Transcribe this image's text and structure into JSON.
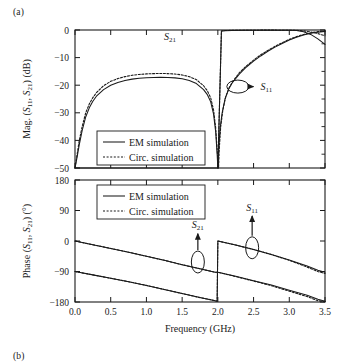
{
  "figure": {
    "panel_a_label": "(a)",
    "panel_b_label": "(b)"
  },
  "chart_data": [
    {
      "type": "line",
      "title": "",
      "panel": "(a)",
      "xlabel": "",
      "ylabel": "Mag. (S11, S21) (dB)",
      "ylabel_parts": {
        "pre": "Mag. (",
        "s1": "S",
        "s1sub": "11",
        "mid": ", ",
        "s2": "S",
        "s2sub": "21",
        "post": ") (dB)"
      },
      "xlim": [
        0.0,
        3.5
      ],
      "ylim": [
        -50,
        0
      ],
      "xticks": [
        0.0,
        0.5,
        1.0,
        1.5,
        2.0,
        2.5,
        3.0,
        3.5
      ],
      "xticklabels": [
        "0.0",
        "0.5",
        "1.0",
        "1.5",
        "2.0",
        "2.5",
        "3.0",
        "3.5"
      ],
      "yticks": [
        0,
        -10,
        -20,
        -30,
        -40,
        -50
      ],
      "yticklabels": [
        "0",
        "−10",
        "−20",
        "−30",
        "−40",
        "−50"
      ],
      "grid": false,
      "legend": {
        "position": "lower-left-inside",
        "entries": [
          {
            "label": "EM simulation",
            "style": "solid"
          },
          {
            "label": "Circ. simulation",
            "style": "dotted"
          }
        ]
      },
      "annotations": [
        {
          "text": "S21",
          "base": "S",
          "sub": "21",
          "x_ghz": 1.33,
          "y_db": -2.2,
          "pointer": "none"
        },
        {
          "text": "S11",
          "base": "S",
          "sub": "11",
          "x_ghz": 2.68,
          "y_db": -20.5,
          "pointer": "ellipse-arrow-right",
          "ellipse_x_ghz": 2.28,
          "ellipse_y_db": -20.5
        }
      ],
      "series": [
        {
          "name": "S21 EM simulation",
          "style": "solid",
          "x": [
            0.0,
            0.05,
            0.1,
            0.15,
            0.2,
            0.3,
            0.4,
            0.5,
            0.6,
            0.7,
            0.8,
            1.0,
            1.2,
            1.4,
            1.6,
            1.8,
            1.9,
            1.95,
            2.0,
            2.05,
            2.1,
            2.2,
            2.4,
            2.6,
            2.8,
            3.0,
            3.1,
            3.2,
            3.3,
            3.4,
            3.5
          ],
          "y": [
            -50,
            -50,
            -50,
            -50,
            -50,
            -50,
            -50,
            -50,
            -50,
            -50,
            -50,
            -50,
            -50,
            -50,
            -50,
            -50,
            -50,
            -50,
            -50,
            -0.4,
            -0.25,
            -0.15,
            -0.1,
            -0.08,
            -0.08,
            -0.1,
            -0.2,
            -0.6,
            -1.6,
            -3.2,
            -5.2
          ]
        },
        {
          "name": "S21 Circ. simulation",
          "style": "dotted",
          "x": [
            2.0,
            2.05,
            2.1,
            2.2,
            2.4,
            2.6,
            2.8,
            3.0,
            3.1,
            3.2,
            3.3,
            3.4,
            3.5
          ],
          "y": [
            -50,
            -0.35,
            -0.2,
            -0.12,
            -0.08,
            -0.06,
            -0.06,
            -0.08,
            -0.12,
            -0.3,
            -0.7,
            -1.3,
            -2.1
          ]
        },
        {
          "name": "S11 EM simulation",
          "style": "solid",
          "x": [
            0.0,
            0.03,
            0.06,
            0.1,
            0.15,
            0.2,
            0.25,
            0.3,
            0.4,
            0.5,
            0.6,
            0.7,
            0.8,
            0.9,
            1.0,
            1.1,
            1.2,
            1.3,
            1.4,
            1.5,
            1.6,
            1.7,
            1.8,
            1.85,
            1.9,
            1.94,
            1.97,
            1.99,
            2.0,
            2.01,
            2.03,
            2.06,
            2.1,
            2.15,
            2.2,
            2.3,
            2.4,
            2.5,
            2.6,
            2.7,
            2.8,
            2.9,
            3.0,
            3.1,
            3.2,
            3.3,
            3.4,
            3.5
          ],
          "y": [
            -50,
            -46,
            -41.5,
            -36.5,
            -31.5,
            -28.2,
            -25.8,
            -24.0,
            -21.6,
            -20.0,
            -19.0,
            -18.3,
            -17.8,
            -17.5,
            -17.3,
            -17.2,
            -17.15,
            -17.2,
            -17.35,
            -17.7,
            -18.3,
            -19.4,
            -21.6,
            -23.3,
            -26.0,
            -30.5,
            -37.0,
            -45.0,
            -50,
            -44.0,
            -36.0,
            -30.0,
            -25.0,
            -21.5,
            -19.2,
            -16.0,
            -13.4,
            -11.3,
            -9.4,
            -7.7,
            -6.2,
            -4.9,
            -3.6,
            -2.6,
            -1.8,
            -1.2,
            -0.8,
            -0.5
          ]
        },
        {
          "name": "S11 Circ. simulation",
          "style": "dotted",
          "x": [
            0.0,
            0.03,
            0.06,
            0.1,
            0.15,
            0.2,
            0.25,
            0.3,
            0.4,
            0.5,
            0.6,
            0.7,
            0.8,
            0.9,
            1.0,
            1.1,
            1.2,
            1.3,
            1.4,
            1.5,
            1.6,
            1.7,
            1.8,
            1.85,
            1.9,
            1.94,
            1.97,
            1.99,
            2.01,
            2.02,
            2.04,
            2.07,
            2.11,
            2.16,
            2.21,
            2.3,
            2.4,
            2.5,
            2.6,
            2.7,
            2.8,
            2.9,
            3.0,
            3.1,
            3.2,
            3.3,
            3.4,
            3.5
          ],
          "y": [
            -50,
            -45,
            -40.0,
            -35.0,
            -30.0,
            -26.8,
            -24.5,
            -22.7,
            -20.2,
            -18.6,
            -17.6,
            -16.9,
            -16.4,
            -16.1,
            -15.9,
            -15.8,
            -15.75,
            -15.8,
            -15.95,
            -16.3,
            -16.9,
            -18.0,
            -20.2,
            -21.9,
            -24.6,
            -29.0,
            -35.5,
            -43.5,
            -50,
            -43.0,
            -35.0,
            -29.0,
            -24.2,
            -20.8,
            -18.6,
            -15.5,
            -13.0,
            -10.9,
            -9.0,
            -7.4,
            -5.9,
            -4.6,
            -3.4,
            -2.4,
            -1.6,
            -1.0,
            -0.6,
            -0.35
          ]
        }
      ]
    },
    {
      "type": "line",
      "panel": "(b)",
      "title": "",
      "xlabel": "Frequency (GHz)",
      "ylabel": "Phase (S11, S21) (°)",
      "ylabel_parts": {
        "pre": "Phase (",
        "s1": "S",
        "s1sub": "11",
        "mid": ", ",
        "s2": "S",
        "s2sub": "21",
        "post": ") (°)"
      },
      "xlim": [
        0.0,
        3.5
      ],
      "ylim": [
        -180,
        180
      ],
      "xticks": [
        0.0,
        0.5,
        1.0,
        1.5,
        2.0,
        2.5,
        3.0,
        3.5
      ],
      "xticklabels": [
        "0.0",
        "0.5",
        "1.0",
        "1.5",
        "2.0",
        "2.5",
        "3.0",
        "3.5"
      ],
      "yticks": [
        180,
        90,
        0,
        -90,
        -180
      ],
      "yticklabels": [
        "180",
        "90",
        "0",
        "−90",
        "−180"
      ],
      "grid": false,
      "legend": {
        "position": "upper-left-inside",
        "entries": [
          {
            "label": "EM simulation",
            "style": "solid"
          },
          {
            "label": "Circ. simulation",
            "style": "dotted"
          }
        ]
      },
      "annotations": [
        {
          "text": "S21",
          "base": "S",
          "sub": "21",
          "x_ghz": 1.72,
          "y_deg": 48,
          "pointer": "ellipse-arrow-up",
          "ellipse_x_ghz": 1.72,
          "ellipse_y_deg": -62
        },
        {
          "text": "S11",
          "base": "S",
          "sub": "11",
          "x_ghz": 2.48,
          "y_deg": 100,
          "pointer": "ellipse-arrow-up",
          "ellipse_x_ghz": 2.48,
          "ellipse_y_deg": -20
        }
      ],
      "series": [
        {
          "name": "S21 EM simulation",
          "style": "solid",
          "x": [
            0.0,
            0.25,
            0.5,
            0.75,
            1.0,
            1.25,
            1.5,
            1.75,
            1.96,
            1.96,
            2.0,
            2.25,
            2.5,
            2.75,
            3.0,
            3.25,
            3.4,
            3.4,
            3.5
          ],
          "y": [
            0,
            -11,
            -22,
            -33,
            -45,
            -57,
            -70,
            -82,
            -92,
            -92,
            -92,
            -104,
            -117,
            -130,
            -145,
            -160,
            -172,
            -172,
            -178
          ]
        },
        {
          "name": "S21 Circ. simulation",
          "style": "dotted",
          "x": [
            0.0,
            0.25,
            0.5,
            0.75,
            1.0,
            1.25,
            1.5,
            1.75,
            1.96,
            2.0,
            2.25,
            2.5,
            2.75,
            3.0,
            3.25,
            3.4,
            3.5
          ],
          "y": [
            0,
            -11,
            -22,
            -33,
            -45,
            -57,
            -70,
            -82,
            -92,
            -92,
            -105,
            -118,
            -132,
            -148,
            -164,
            -176,
            -179
          ]
        },
        {
          "name": "S11 EM simulation",
          "style": "solid",
          "x": [
            0.0,
            0.25,
            0.5,
            0.75,
            1.0,
            1.25,
            1.5,
            1.75,
            1.96,
            1.99,
            2.0,
            2.25,
            2.5,
            2.75,
            3.0,
            3.25,
            3.4,
            3.5
          ],
          "y": [
            -90,
            -100,
            -110,
            -120,
            -131,
            -143,
            -155,
            -167,
            -176,
            -178,
            0,
            -12,
            -25,
            -40,
            -56,
            -74,
            -86,
            -92
          ]
        },
        {
          "name": "S11 Circ. simulation",
          "style": "dotted",
          "x": [
            0.0,
            0.25,
            0.5,
            0.75,
            1.0,
            1.25,
            1.5,
            1.75,
            1.96,
            1.99,
            2.0,
            2.25,
            2.5,
            2.75,
            3.0,
            3.25,
            3.4,
            3.5
          ],
          "y": [
            -90,
            -100,
            -110,
            -120,
            -131,
            -143,
            -155,
            -167,
            -176,
            -178,
            0,
            -12,
            -25,
            -40,
            -57,
            -77,
            -90,
            -96
          ]
        }
      ]
    }
  ]
}
